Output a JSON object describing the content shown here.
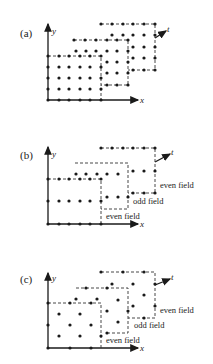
{
  "figure": {
    "panels": [
      {
        "id": "a",
        "label": "(a)",
        "axis_x": "x",
        "axis_y": "y",
        "axis_t": "t"
      },
      {
        "id": "b",
        "label": "(b)",
        "axis_x": "x",
        "axis_y": "y",
        "axis_t": "t",
        "annotations": [
          "even field",
          "odd field",
          "even field"
        ]
      },
      {
        "id": "c",
        "label": "(c)",
        "axis_x": "x",
        "axis_y": "y",
        "axis_t": "t",
        "annotations": [
          "even field",
          "odd field",
          "even field"
        ]
      }
    ]
  }
}
